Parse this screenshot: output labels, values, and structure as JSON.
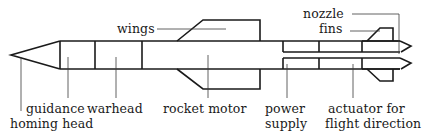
{
  "diagram": {
    "colors": {
      "line": "#1a1a1a",
      "background": "#ffffff"
    },
    "labels": {
      "wings": "wings",
      "nozzle": "nozzle",
      "fins": "fins",
      "guidance": "guidance",
      "homing_head": "homing head",
      "warhead": "warhead",
      "rocket_motor": "rocket motor",
      "power_supply_1": "power",
      "power_supply_2": "supply",
      "actuator_1": "actuator for",
      "actuator_2": "flight direction"
    }
  }
}
